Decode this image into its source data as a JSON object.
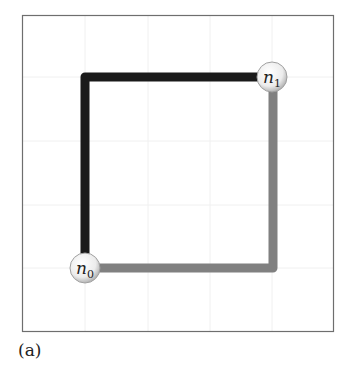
{
  "caption": "(a)",
  "nodes": [
    {
      "id": "n0",
      "base": "n",
      "sub": "0",
      "cx": 85,
      "cy": 268
    },
    {
      "id": "n1",
      "base": "n",
      "sub": "1",
      "cx": 272,
      "cy": 77
    }
  ],
  "edges": [
    {
      "from": "n0",
      "to": "n1",
      "route": "up-then-right",
      "color": "#1a1a1a"
    },
    {
      "from": "n0",
      "to": "n1",
      "route": "right-then-up",
      "color": "#808080"
    }
  ],
  "colors": {
    "frame": "#6e6e6e",
    "grid": "#eeeeee",
    "dark_path": "#1a1a1a",
    "gray_path": "#808080",
    "node_fill": "#f4f4f4",
    "node_stroke": "#a0a0a0"
  }
}
